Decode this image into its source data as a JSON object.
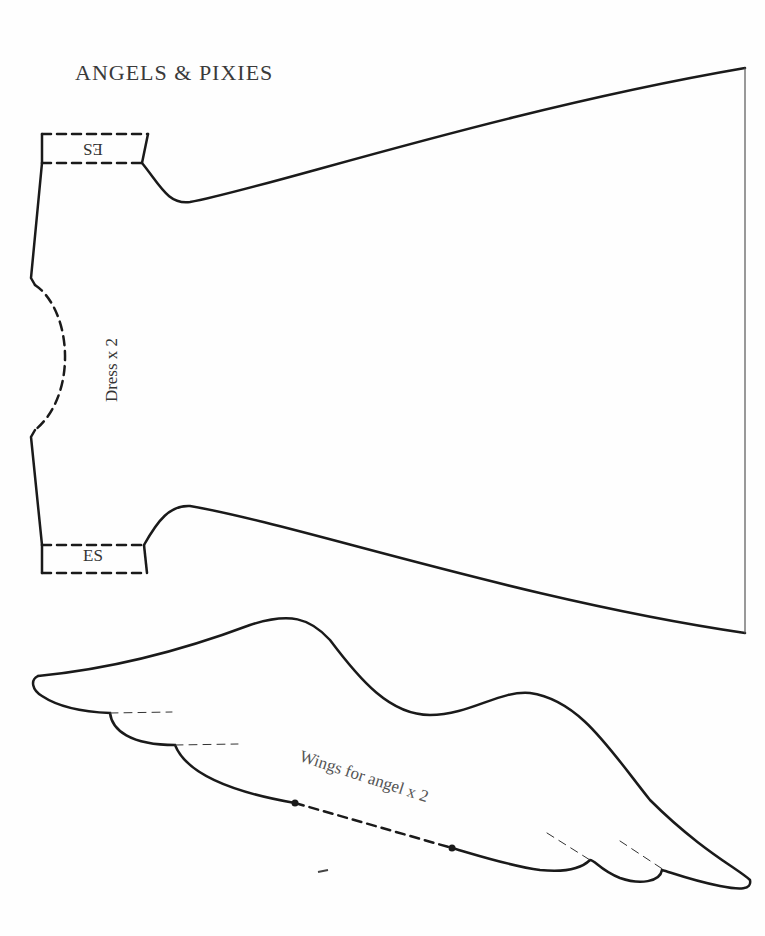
{
  "document": {
    "title": "ANGELS & PIXIES",
    "pieces": [
      {
        "name": "Dress",
        "label": "Dress x 2",
        "markers": [
          {
            "text": "ES",
            "position": "top-sleeve",
            "orientation": "upside-down"
          },
          {
            "text": "ES",
            "position": "bottom-sleeve",
            "orientation": "normal"
          }
        ]
      },
      {
        "name": "Wings",
        "label": "Wings for angel x 2"
      }
    ]
  },
  "colors": {
    "line": "#1a1a1a",
    "text": "#333333",
    "background": "#fefefe"
  }
}
